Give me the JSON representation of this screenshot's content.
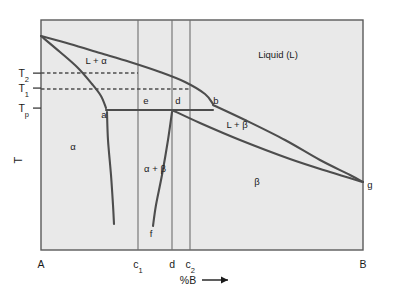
{
  "figure": {
    "type": "phase-diagram",
    "title": "",
    "background_color": "#e9e9e9",
    "frame_color": "#5a5a5a",
    "curve_color": "#4d4d4d",
    "text_color": "#1a1a1a"
  },
  "axes": {
    "x_label": "%B",
    "x_arrow": "⟶",
    "y_label": "T",
    "x_ticks": [
      {
        "id": "A",
        "label": "A",
        "x_frac": 0.0
      },
      {
        "id": "c1",
        "label": "c",
        "sub": "1",
        "x_frac": 0.301
      },
      {
        "id": "d",
        "label": "d",
        "sub": "",
        "x_frac": 0.407
      },
      {
        "id": "c2",
        "label": "c",
        "sub": "2",
        "x_frac": 0.463
      },
      {
        "id": "B",
        "label": "B",
        "x_frac": 1.0
      }
    ],
    "y_ticks": [
      {
        "id": "T2",
        "label": "T",
        "sub": "2",
        "y_frac": 0.231
      },
      {
        "id": "T1",
        "label": "T",
        "sub": "1",
        "y_frac": 0.296
      },
      {
        "id": "Tp",
        "label": "T",
        "sub": "p",
        "y_frac": 0.383
      }
    ]
  },
  "regions": [
    {
      "id": "liquid",
      "label": "Liquid (L)",
      "x": 278,
      "y": 58,
      "size": 9.5
    },
    {
      "id": "l-plus-alpha",
      "label": "L + α",
      "x": 96,
      "y": 64,
      "size": 9.5
    },
    {
      "id": "l-plus-beta",
      "label": "L + β",
      "x": 237,
      "y": 128,
      "size": 9.5
    },
    {
      "id": "alpha",
      "label": "α",
      "x": 73,
      "y": 150,
      "size": 9.5
    },
    {
      "id": "alpha-plus-beta",
      "label": "α + β",
      "x": 155,
      "y": 172,
      "size": 9.5
    },
    {
      "id": "beta",
      "label": "β",
      "x": 257,
      "y": 185,
      "size": 9.5
    }
  ],
  "point_labels": [
    {
      "id": "a",
      "label": "a",
      "x": 104,
      "y": 118
    },
    {
      "id": "e",
      "label": "e",
      "x": 146,
      "y": 104
    },
    {
      "id": "d",
      "label": "d",
      "x": 178,
      "y": 104
    },
    {
      "id": "b",
      "label": "b",
      "x": 216,
      "y": 104
    },
    {
      "id": "f",
      "label": "f",
      "x": 151,
      "y": 237
    },
    {
      "id": "g",
      "label": "g",
      "x": 370,
      "y": 188
    }
  ],
  "chart_data": {
    "type": "line",
    "title": "",
    "xlabel": "%B",
    "ylabel": "T",
    "plot_box": {
      "left": 41,
      "top": 20,
      "right": 363,
      "bottom": 250
    },
    "gridlines_vertical": [
      {
        "id": "c1-line",
        "x": 138,
        "from_y": 20,
        "to_y": 250
      },
      {
        "id": "d-line",
        "x": 172,
        "from_y": 20,
        "to_y": 250
      },
      {
        "id": "c2-line",
        "x": 190,
        "from_y": 20,
        "to_y": 250
      }
    ],
    "series": [
      {
        "name": "liquidus-alpha",
        "description": "Upper liquidus from A melting point down to peritectic point b",
        "points": [
          [
            41,
            36
          ],
          [
            70,
            44
          ],
          [
            100,
            53
          ],
          [
            130,
            62
          ],
          [
            160,
            72
          ],
          [
            185,
            82
          ],
          [
            205,
            94
          ],
          [
            213,
            104
          ]
        ]
      },
      {
        "name": "solidus-alpha",
        "description": "Solidus from A melting point down to point a (peritectic)",
        "points": [
          [
            41,
            36
          ],
          [
            60,
            52
          ],
          [
            78,
            68
          ],
          [
            92,
            84
          ],
          [
            101,
            96
          ],
          [
            106,
            108
          ]
        ]
      },
      {
        "name": "peritectic-line",
        "description": "Horizontal peritectic isotherm Tp from a through e and d to b",
        "points": [
          [
            106,
            110
          ],
          [
            213,
            110
          ]
        ]
      },
      {
        "name": "solidus-beta",
        "description": "Beta solidus from d down-right to g",
        "points": [
          [
            172,
            110
          ],
          [
            200,
            123
          ],
          [
            240,
            140
          ],
          [
            290,
            159
          ],
          [
            330,
            172
          ],
          [
            363,
            182
          ]
        ]
      },
      {
        "name": "liquidus-beta",
        "description": "Beta liquidus from b down-right to g",
        "points": [
          [
            213,
            105
          ],
          [
            245,
            120
          ],
          [
            285,
            140
          ],
          [
            320,
            160
          ],
          [
            350,
            175
          ],
          [
            363,
            182
          ]
        ]
      },
      {
        "name": "solvus-alpha",
        "description": "Alpha solvus from a curving down-left",
        "points": [
          [
            107,
            112
          ],
          [
            108,
            140
          ],
          [
            111,
            175
          ],
          [
            113,
            205
          ],
          [
            114,
            224
          ]
        ]
      },
      {
        "name": "solvus-beta",
        "description": "Beta solvus from d curving down-left to f",
        "points": [
          [
            172,
            112
          ],
          [
            168,
            140
          ],
          [
            162,
            175
          ],
          [
            156,
            205
          ],
          [
            153,
            226
          ]
        ]
      }
    ],
    "dashed_tielines": [
      {
        "id": "T2-tieline",
        "y": 73,
        "from_x": 41,
        "to_x": 138
      },
      {
        "id": "T1-tieline",
        "y": 89,
        "from_x": 41,
        "to_x": 190
      }
    ]
  }
}
